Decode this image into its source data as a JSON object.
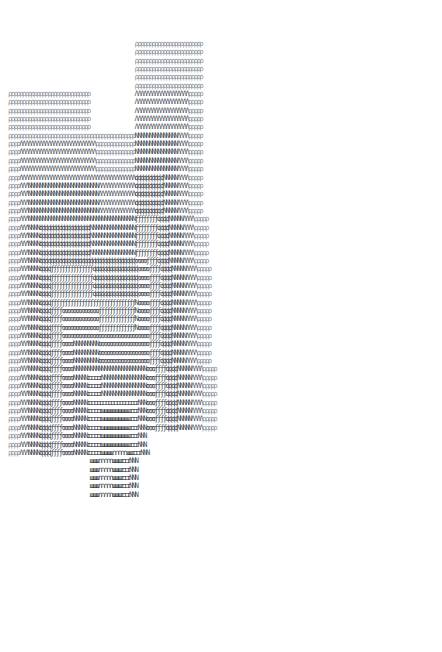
{
  "art": {
    "glyph_legend": {
      "P": "ρ",
      "A": "Λ",
      "N": "N",
      "d": "ɖ",
      "f": "ƒ",
      "E": "ɞ",
      "I": "ɪ",
      "W": "ш",
      "n": "∩",
      " ": " "
    },
    "rows": [
      "                                             PPPPPPPPPPPPPPPPPPPPPPPP",
      "                                             PPPPPPPPPPPPPPPPPPPPPPPP",
      "                                             PPPPPPPPPPPPPPPPPPPPPPPP",
      "                                             PPPPPPPPPPPPPPPPPPPPPPPP",
      "                                             PPPPPPPPPPPPPPPPPPPPPPPP",
      "                                             PPPPPPPPPPPPPPPPPPPPPPPP",
      "PPPPPPPPPPPPPPPPPPPPPPPPPPPPP                AAAAAAAAAAAAAAAAAAAPPPPP",
      "PPPPPPPPPPPPPPPPPPPPPPPPPPPPP                AAAAAAAAAAAAAAAAAAAPPPPP",
      "PPPPPPPPPPPPPPPPPPPPPPPPPPPPP                AAAAAAAAAAAAAAAAAAAPPPPP",
      "PPPPPPPPPPPPPPPPPPPPPPPPPPPPP                AAAAAAAAAAAAAAAAAAAPPPPP",
      "PPPPPPPPPPPPPPPPPPPPPPPPPPPPP                AAAAAAAAAAAAAAAAAAAPPPPP",
      "PPPPPPPPPPPPPPPPPPPPPPPPPPPPPPPPPPPPPPPPPPPPPNNNNNNNNNNNNNNNAAAAPPPPP",
      "PPPPAAAAAAAAAAAAAAAAAAAAAAAAAAAPPPPPPPPPPPPPPNNNNNNNNNNNNNNNAAAAPPPPP",
      "PPPPAAAAAAAAAAAAAAAAAAAAAAAAAAAPPPPPPPPPPPPPPNNNNNNNNNNNNNNNAAAAPPPPP",
      "PPPPAAAAAAAAAAAAAAAAAAAAAAAAAAAPPPPPPPPPPPPPPNNNNNNNNNNNNNNNAAAAPPPPP",
      "PPPPAAAAAAAAAAAAAAAAAAAAAAAAAAAPPPPPPPPPPPPPPNNNNNNNNNNNNNNNAAAAPPPPP",
      "PPPPAAAAAAAAAAAAAAAAAAAAAAAAAAAAAAAAAAAAAAAAAddddddddddNNNNNAAAAPPPPP",
      "PPPPAAANNNNNNNNNNNNNNNNNNNNNNNNNAAAAAAAAAAAAAddddddddddNNNNNAAAAPPPPP",
      "PPPPAAANNNNNNNNNNNNNNNNNNNNNNNNNAAAAAAAAAAAAAddddddddddNNNNNAAAAPPPPP",
      "PPPPAAANNNNNNNNNNNNNNNNNNNNNNNNNAAAAAAAAAAAAAddddddddddNNNNNAAAAPPPPP",
      "PPPPAAANNNNNNNNNNNNNNNNNNNNNNNNNAAAAAAAAAAAAAddddddddddNNNNNAAAAPPPPP",
      "PPPPAAANNNNNNNNNNNNNNNNNNNNNNNNNNNNNNNNNNNNNNffffffffddddNNNNNAAAAPPPPP",
      "PPPPAAANNNNddddddddddddddddddNNNNNNNNNNNNNNNNffffffffddddNNNNNAAAAPPPPP",
      "PPPPAAANNNNddddddddddddddddddNNNNNNNNNNNNNNNNffffffffddddNNNNNAAAAPPPPP",
      "PPPPAAANNNNddddddddddddddddddNNNNNNNNNNNNNNNNffffffffddddNNNNNAAAAPPPPP",
      "PPPPAAANNNNddddddddddddddddddNNNNNNNNNNNNNNNNffffffffddddNNNNNAAAAPPPPP",
      "PPPPAAANNNNddddddddddddddddddddddddddddddddddEEEEffffddddNNNNNAAAAPPPPP",
      "PPPPAAANNNNddddfffffffffffffffddddddddddddddddEEEEffffddddNNNNNAAAAPPPPP",
      "PPPPAAANNNNddddfffffffffffffffddddddddddddddddEEEEffffddddNNNNNAAAAPPPPP",
      "PPPPAAANNNNddddfffffffffffffffddddddddddddddddEEEEffffddddNNNNNAAAAPPPPP",
      "PPPPAAANNNNddddfffffffffffffffddddddddddddddddEEEEffffddddNNNNNAAAAPPPPP",
      "PPPPAAANNNNddddffffffffffffffffffffffffffffffNEEEEffffddddNNNNNAAAAPPPPP",
      "PPPPAAANNNNddddffffEEEEEEEEEEEEEfffffffffffffNEEEEffffddddNNNNNAAAAPPPPP",
      "PPPPAAANNNNddddffffEEEEEEEEEEEEEfffffffffffffNEEEEffffddddNNNNNAAAAPPPPP",
      "PPPPAAANNNNddddffffEEEEEEEEEEEEEfffffffffffffNEEEEffffddddNNNNNAAAAPPPPP",
      "PPPPAAANNNNddddffffEEEEEEEEEEEEEEEEEEEEEEEEEEEEEEEffffddddNNNNNAAAAPPPPP",
      "PPPPAAANNNNddddffffEEEENNNNNNNNNEEEEEEEEEEEEEEEEEEffffddddNNNNNAAAAPPPPP",
      "PPPPAAANNNNddddffffEEEENNNNNNNNNEEEEEEEEEEEEEEEEEEffffddddNNNNNAAAAPPPPP",
      "PPPPAAANNNNddddffffEEEENNNNNNNNNEEEEEEEEEEEEEEEEEEffffddddNNNNNAAAAPPPPP",
      "PPPPAAANNNNddddffffEEEENNNNNNNNNNNNNNNNNNNNNNNNNNEEEffffddddNNNNNAAAAPPPPP",
      "PPPPAAANNNNddddffffEEEENNNNNIIIIINNNNNNNNNNNNNNNNEEEffffddddNNNNNAAAAPPPPP",
      "PPPPAAANNNNddddffffEEEENNNNNIIIIINNNNNNNNNNNNNNNNEEEffffddddNNNNNAAAAPPPPP",
      "PPPPAAANNNNddddffffEEEENNNNNIIIIINNNNNNNNNNNNNNNNEEEffffddddNNNNNAAAAPPPPP",
      "PPPPAAANNNNddddffffEEEENNNNNIIIIIIIIIIIIIIIIIINNNEEEffffddddNNNNNAAAAPPPPP",
      "PPPPAAANNNNddddffffEEEENNNNNIIIIIWWWWWWWWWWIIINNNEEEffffddddNNNNNAAAAPPPPP",
      "PPPPAAANNNNddddffffEEEENNNNNIIIIIWWWWWWWWWWIIINNNEEEffffddddNNNNNAAAAPPPPP",
      "PPPPAAANNNNddddffffEEEENNNNNIIIIIWWWWWWWWWWIIINNNEEEffffddddNNNNNAAAAPPPPP",
      "PPPPAAANNNNddddffffEEEENNNNNIIIIIWWWWWWWWWWIIINNN",
      "PPPPAAANNNNddddffffEEEENNNNNIIIIIWWWWWWWWWWIIINNN",
      "PPPPAAANNNNddddffffEEEENNNNNIIIIIWWWWnnnnnWWIIINNN",
      "                             WWWnnnnnWWWIIINNN",
      "                             WWWnnnnnWWWIIINNN",
      "                             WWWnnnnnWWWIIINNN",
      "                             WWWnnnnnWWWIIINNN",
      "                             WWWnnnnnWWWIIINNN"
    ]
  }
}
